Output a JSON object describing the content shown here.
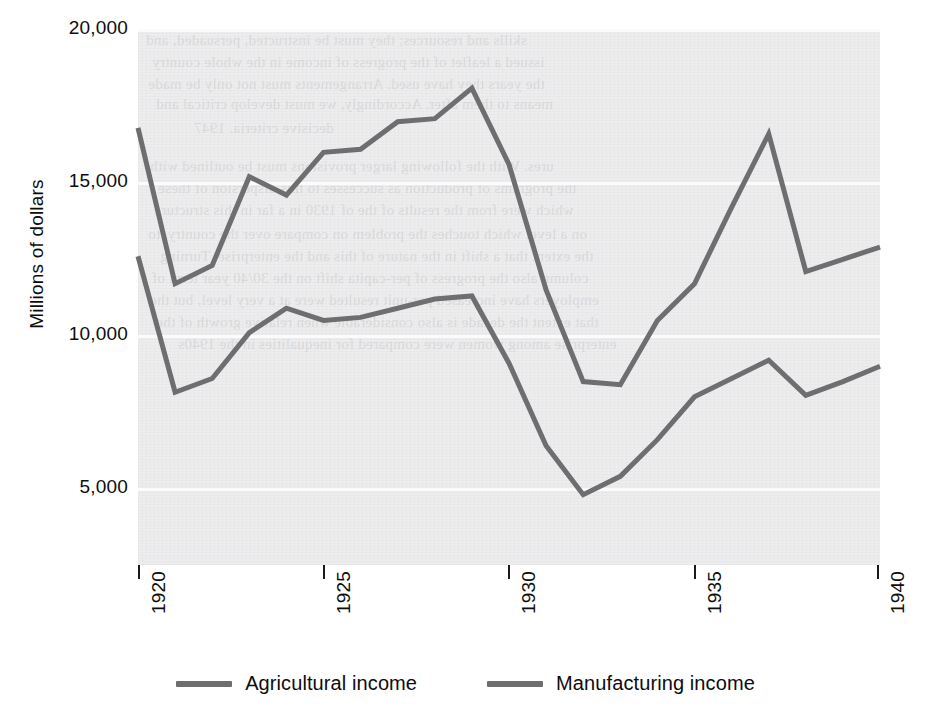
{
  "chart_data": {
    "type": "line",
    "title": "",
    "xlabel": "",
    "ylabel": "Millions of dollars",
    "x": [
      1920,
      1921,
      1922,
      1923,
      1924,
      1925,
      1926,
      1927,
      1928,
      1929,
      1930,
      1931,
      1932,
      1933,
      1934,
      1935,
      1936,
      1937,
      1938,
      1939,
      1940
    ],
    "xlim": [
      1920,
      1940
    ],
    "ylim": [
      2500,
      20000
    ],
    "xticks": [
      1920,
      1925,
      1930,
      1935,
      1940
    ],
    "xtick_labels": [
      "1920",
      "1925",
      "1930",
      "1935",
      "1940"
    ],
    "yticks": [
      5000,
      10000,
      15000,
      20000
    ],
    "ytick_labels": [
      "5,000",
      "10,000",
      "15,000",
      "20,000"
    ],
    "grid": "horizontal",
    "legend_position": "bottom-center",
    "series": [
      {
        "name": "Agricultural income",
        "color": "#6e6e70",
        "values": [
          12600,
          8150,
          8600,
          10100,
          10900,
          10500,
          10600,
          10900,
          11200,
          11300,
          9100,
          6400,
          4800,
          5400,
          6600,
          8000,
          8600,
          9200,
          8050,
          8500,
          9000
        ]
      },
      {
        "name": "Manufacturing income",
        "color": "#6e6e70",
        "values": [
          16800,
          11700,
          12300,
          15200,
          14600,
          16000,
          16100,
          17000,
          17100,
          18100,
          15600,
          11500,
          8500,
          8400,
          10500,
          11700,
          14200,
          16600,
          12100,
          12500,
          12900
        ]
      }
    ]
  },
  "style": {
    "plot_background": "#ededee",
    "gridline_color": "#fbfbfb",
    "text_color": "#0d0d0d",
    "line_width": 5
  },
  "ghost_text": [
    {
      "text": "skills and resources; they must be instructed, persuaded, and",
      "x": 8,
      "y": 2
    },
    {
      "text": "issued a leaflet of the progress of income in the whole country",
      "x": 14,
      "y": 24
    },
    {
      "text": "the years they have used. Arrangements must not only be made",
      "x": 10,
      "y": 46
    },
    {
      "text": "means to them after. Accordingly, we must develop critical and",
      "x": 18,
      "y": 66
    },
    {
      "text": "decisive criteria. 1947",
      "x": 56,
      "y": 90
    },
    {
      "text": "ures. With the following larger provisions must be outlined with",
      "x": 12,
      "y": 128
    },
    {
      "text": "the programs of production as successes to this dispersion of these",
      "x": 20,
      "y": 150
    },
    {
      "text": "which were from the results of the of 1930 in a far in this structure",
      "x": 16,
      "y": 172
    },
    {
      "text": "on a level which touches the problem on compare over the country, to",
      "x": 10,
      "y": 196
    },
    {
      "text": "the extent that a shift in the nature of this and the enterprise. Turning",
      "x": 22,
      "y": 218
    },
    {
      "text": "column also the progress of per-capita shift on the 30/40 year term of",
      "x": 14,
      "y": 240
    },
    {
      "text": "employers have increased per-unit resulted were at a very level, but the",
      "x": 12,
      "y": 262
    },
    {
      "text": "that extent the decade is also considerable when relative growth of the",
      "x": 18,
      "y": 284
    },
    {
      "text": "enterprise among women were compared for inequalities in the 1940s",
      "x": 40,
      "y": 306
    }
  ]
}
